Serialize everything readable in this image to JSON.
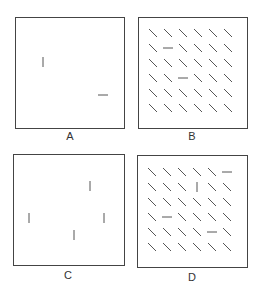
{
  "panels": [
    {
      "id": "A",
      "label": "A",
      "box": [
        15,
        17,
        110,
        112
      ],
      "label_pos": [
        70,
        137
      ],
      "marks": [
        {
          "x": 43,
          "y": 62,
          "type": "v"
        },
        {
          "x": 103,
          "y": 95,
          "type": "h"
        }
      ]
    },
    {
      "id": "B",
      "label": "B",
      "box": [
        138,
        17,
        110,
        112
      ],
      "label_pos": [
        192,
        137
      ],
      "grid": {
        "x0": 153,
        "y0": 33,
        "dx": 15,
        "dy": 15,
        "rows": 6,
        "cols": 6,
        "default": "d"
      },
      "exceptions": [
        {
          "r": 1,
          "c": 1,
          "type": "h"
        },
        {
          "r": 3,
          "c": 2,
          "type": "h"
        }
      ]
    },
    {
      "id": "C",
      "label": "C",
      "box": [
        13,
        154,
        112,
        112
      ],
      "label_pos": [
        68,
        276
      ],
      "marks": [
        {
          "x": 29,
          "y": 218,
          "type": "v"
        },
        {
          "x": 90,
          "y": 186,
          "type": "v"
        },
        {
          "x": 104,
          "y": 218,
          "type": "v"
        },
        {
          "x": 74,
          "y": 235,
          "type": "v"
        }
      ]
    },
    {
      "id": "D",
      "label": "D",
      "box": [
        137,
        155,
        111,
        113
      ],
      "label_pos": [
        192,
        278
      ],
      "grid": {
        "x0": 152,
        "y0": 172,
        "dx": 15,
        "dy": 15,
        "rows": 6,
        "cols": 6,
        "default": "d"
      },
      "exceptions": [
        {
          "r": 0,
          "c": 5,
          "type": "h"
        },
        {
          "r": 1,
          "c": 3,
          "type": "v"
        },
        {
          "r": 3,
          "c": 1,
          "type": "h"
        },
        {
          "r": 4,
          "c": 4,
          "type": "h"
        }
      ]
    }
  ],
  "colors": {
    "line": "#555555",
    "frame": "#444444"
  }
}
